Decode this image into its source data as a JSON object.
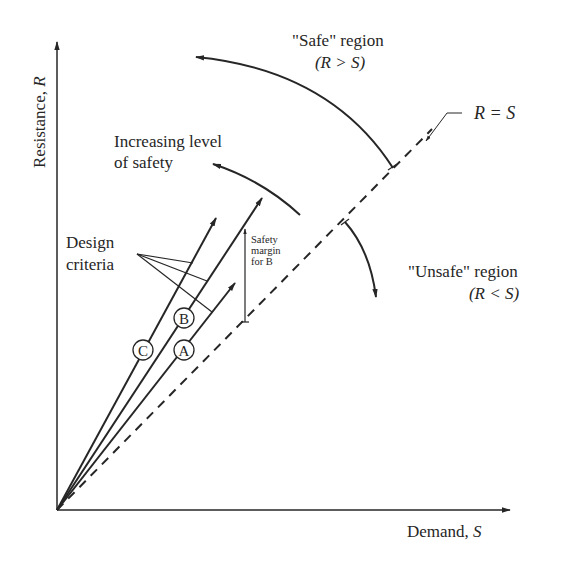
{
  "diagram": {
    "axes": {
      "y_label": "Resistance, ",
      "y_symbol": "R",
      "x_label": "Demand, ",
      "x_symbol": "S"
    },
    "regions": {
      "safe": {
        "label": "\"Safe\" region",
        "condition": "(R > S)"
      },
      "unsafe": {
        "label": "\"Unsafe\" region",
        "condition": "(R < S)"
      }
    },
    "limit_line": {
      "label": "R = S",
      "style": "dashed"
    },
    "annotations": {
      "increasing_safety_line1": "Increasing level",
      "increasing_safety_line2": "of safety",
      "design_criteria_line1": "Design",
      "design_criteria_line2": "criteria",
      "safety_margin_line1": "Safety",
      "safety_margin_line2": "margin",
      "safety_margin_line3": "for B"
    },
    "design_lines": [
      {
        "id": "A",
        "label": "A"
      },
      {
        "id": "B",
        "label": "B"
      },
      {
        "id": "C",
        "label": "C"
      }
    ],
    "colors": {
      "ink": "#262626",
      "background": "#ffffff"
    }
  }
}
